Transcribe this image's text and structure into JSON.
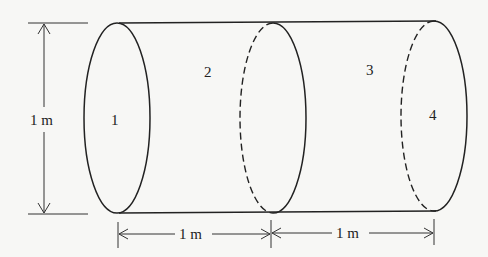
{
  "diagram": {
    "section_labels": [
      "1",
      "2",
      "3",
      "4"
    ],
    "dimensions": {
      "height_label": "1 m",
      "length_left_label": "1 m",
      "length_right_label": "1 m"
    }
  }
}
